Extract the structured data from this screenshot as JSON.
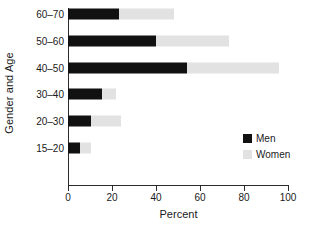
{
  "chart_data": {
    "type": "bar",
    "orientation": "horizontal",
    "stacked": true,
    "title": "",
    "xlabel": "Percent",
    "ylabel": "Gender and Age",
    "categories": [
      "60–70",
      "50–60",
      "40–50",
      "30–40",
      "20–30",
      "15–20"
    ],
    "series": [
      {
        "name": "Men",
        "color": "#111111",
        "values": [
          23,
          40,
          54,
          15.5,
          10.5,
          5.5
        ]
      },
      {
        "name": "Women",
        "color": "#e2e2e2",
        "values": [
          25,
          33,
          42,
          6.5,
          13.5,
          5
        ]
      }
    ],
    "cumulative_totals": [
      48,
      73,
      96,
      22,
      24,
      10.5
    ],
    "xlim": [
      0,
      100
    ],
    "xticks": [
      0,
      20,
      40,
      60,
      80,
      100
    ],
    "xtick_labels": [
      "0",
      "20",
      "40",
      "60",
      "80",
      "100"
    ],
    "grid": false,
    "legend_position": "bottom-right",
    "legend_entries": [
      "Men",
      "Women"
    ]
  },
  "axes": {
    "x_title": "Percent",
    "y_title": "Gender and Age"
  },
  "legend": {
    "items": [
      {
        "label": "Men",
        "swatch": "#111111"
      },
      {
        "label": "Women",
        "swatch": "#e2e2e2"
      }
    ]
  }
}
